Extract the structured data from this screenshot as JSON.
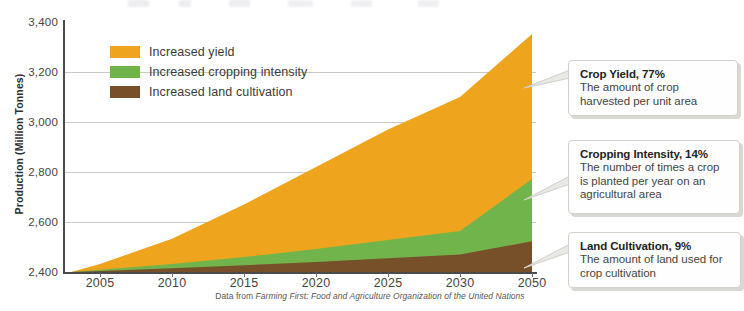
{
  "chart_data": {
    "type": "area",
    "stacked": true,
    "title": "",
    "xlabel": "",
    "ylabel": "Production (Million Tonnes)",
    "ylim": [
      2400,
      3400
    ],
    "ytick_labels": [
      "3,400",
      "3,200",
      "3,000",
      "2,800",
      "2,600",
      "2,400"
    ],
    "ytick_values": [
      3400,
      3200,
      3000,
      2800,
      2600,
      2400
    ],
    "xtick_labels": [
      "2005",
      "2010",
      "2015",
      "2020",
      "2025",
      "2030",
      "2050"
    ],
    "xtick_values": [
      2005,
      2010,
      2015,
      2020,
      2025,
      2030,
      2050
    ],
    "grid": true,
    "legend_position": "upper-left",
    "x": [
      2003,
      2005,
      2010,
      2015,
      2020,
      2025,
      2030,
      2050
    ],
    "series": [
      {
        "name": "Increased land cultivation",
        "color": "#77502A",
        "values": [
          2400,
          2404,
          2415,
          2427,
          2440,
          2455,
          2470,
          2523
        ]
      },
      {
        "name": "Increased cropping intensity",
        "color": "#72B44C",
        "values": [
          2400,
          2409,
          2432,
          2460,
          2492,
          2528,
          2564,
          2772
        ]
      },
      {
        "name": "Increased yield",
        "color": "#EFA41E",
        "values": [
          2400,
          2432,
          2533,
          2670,
          2820,
          2970,
          3100,
          3352
        ]
      }
    ],
    "source": "Data from Farming First: Food and Agriculture Organization of the United Nations",
    "source_prefix": "Data from ",
    "source_italic": "Farming First: Food and Agriculture Organization of the United Nations"
  },
  "legend": {
    "items": [
      {
        "label": "Increased yield",
        "color": "#EFA41E"
      },
      {
        "label": "Increased cropping intensity",
        "color": "#72B44C"
      },
      {
        "label": "Increased land cultivation",
        "color": "#77502A"
      }
    ]
  },
  "callouts": [
    {
      "id": "yield",
      "title": "Crop Yield, 77%",
      "line1": "The amount of crop",
      "line2": "harvested per unit area",
      "line3": ""
    },
    {
      "id": "intensity",
      "title": "Cropping Intensity, 14%",
      "line1": "The number of times a crop",
      "line2": "is planted per year on an",
      "line3": "agricultural area"
    },
    {
      "id": "land",
      "title": "Land Cultivation, 9%",
      "line1": "The amount of land used for",
      "line2": "crop cultivation",
      "line3": ""
    }
  ],
  "colors": {
    "yield": "#EFA41E",
    "intensity": "#72B44C",
    "land": "#77502A",
    "axis": "#4b4b49",
    "grid": "#c9c9c4"
  }
}
